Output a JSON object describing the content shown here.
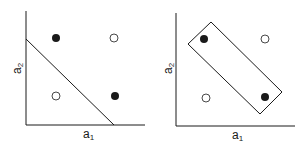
{
  "diagram": {
    "colors": {
      "ink": "#1a1a1a",
      "background": "#ffffff"
    },
    "panels": [
      {
        "id": "left",
        "xlabel": {
          "base": "a",
          "sub": "1"
        },
        "ylabel": {
          "base": "a",
          "sub": "2"
        },
        "separator": "diagonal-line",
        "points": [
          {
            "pos": "top-left",
            "type": "filled"
          },
          {
            "pos": "top-right",
            "type": "open"
          },
          {
            "pos": "bottom-left",
            "type": "open"
          },
          {
            "pos": "bottom-right",
            "type": "filled"
          }
        ]
      },
      {
        "id": "right",
        "xlabel": {
          "base": "a",
          "sub": "1"
        },
        "ylabel": {
          "base": "a",
          "sub": "2"
        },
        "separator": "rotated-rectangle",
        "points": [
          {
            "pos": "top-left",
            "type": "filled"
          },
          {
            "pos": "top-right",
            "type": "open"
          },
          {
            "pos": "bottom-left",
            "type": "open"
          },
          {
            "pos": "bottom-right",
            "type": "filled"
          }
        ]
      }
    ]
  }
}
